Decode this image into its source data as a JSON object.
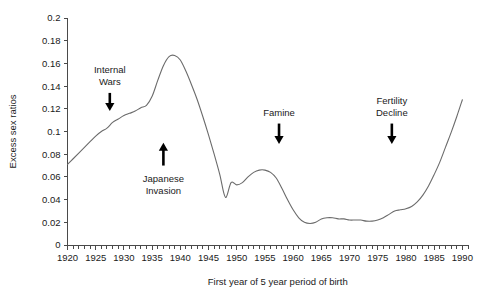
{
  "chart_data": {
    "type": "line",
    "title": "",
    "xlabel": "First year of 5 year period of birth",
    "ylabel": "Excess sex ratios",
    "xlim": [
      1920,
      1991
    ],
    "ylim": [
      0,
      0.2
    ],
    "ytick_labels": [
      "0",
      "0.02",
      "0.04",
      "0.06",
      "0.08",
      "0.1",
      "0.12",
      "0.14",
      "0.16",
      "0.18",
      "0.2"
    ],
    "ytick_values": [
      0,
      0.02,
      0.04,
      0.06,
      0.08,
      0.1,
      0.12,
      0.14,
      0.16,
      0.18,
      0.2
    ],
    "xtick_labels": [
      "1920",
      "1925",
      "1930",
      "1935",
      "1940",
      "1945",
      "1950",
      "1955",
      "1960",
      "1965",
      "1970",
      "1975",
      "1980",
      "1985",
      "1990"
    ],
    "xtick_values": [
      1920,
      1925,
      1930,
      1935,
      1940,
      1945,
      1950,
      1955,
      1960,
      1965,
      1970,
      1975,
      1980,
      1985,
      1990
    ],
    "minor_tick_step": 1,
    "grid": false,
    "legend": false,
    "line_color": "#6b6b6b",
    "series": [
      {
        "name": "Excess sex ratios",
        "x": [
          1920,
          1921,
          1922,
          1923,
          1924,
          1925,
          1926,
          1927,
          1928,
          1929,
          1930,
          1931,
          1932,
          1933,
          1934,
          1935,
          1936,
          1937,
          1938,
          1939,
          1940,
          1941,
          1942,
          1943,
          1944,
          1945,
          1946,
          1947,
          1948,
          1949,
          1950,
          1951,
          1952,
          1953,
          1954,
          1955,
          1956,
          1957,
          1958,
          1959,
          1960,
          1961,
          1962,
          1963,
          1964,
          1965,
          1966,
          1967,
          1968,
          1969,
          1970,
          1971,
          1972,
          1973,
          1974,
          1975,
          1976,
          1977,
          1978,
          1979,
          1980,
          1981,
          1982,
          1983,
          1984,
          1985,
          1986,
          1987,
          1988,
          1989,
          1990
        ],
        "y": [
          0.071,
          0.076,
          0.081,
          0.086,
          0.091,
          0.096,
          0.1,
          0.103,
          0.108,
          0.111,
          0.114,
          0.116,
          0.118,
          0.121,
          0.123,
          0.131,
          0.145,
          0.158,
          0.166,
          0.167,
          0.163,
          0.153,
          0.141,
          0.128,
          0.113,
          0.097,
          0.08,
          0.062,
          0.042,
          0.055,
          0.053,
          0.055,
          0.06,
          0.064,
          0.066,
          0.066,
          0.064,
          0.059,
          0.05,
          0.04,
          0.031,
          0.024,
          0.02,
          0.019,
          0.02,
          0.023,
          0.024,
          0.024,
          0.023,
          0.023,
          0.022,
          0.022,
          0.022,
          0.021,
          0.021,
          0.022,
          0.024,
          0.027,
          0.03,
          0.031,
          0.032,
          0.034,
          0.038,
          0.044,
          0.052,
          0.062,
          0.073,
          0.086,
          0.099,
          0.113,
          0.128
        ]
      }
    ],
    "annotations": [
      {
        "label_line1": "Internal",
        "label_line2": "Wars",
        "x": 1927.5,
        "arrow_top": 0.134,
        "arrow_bottom": 0.118,
        "direction": "down"
      },
      {
        "label_line1": "Japanese",
        "label_line2": "Invasion",
        "x": 1937.0,
        "arrow_top": 0.09,
        "arrow_bottom": 0.07,
        "direction": "up"
      },
      {
        "label_line1": "Famine",
        "label_line2": "",
        "x": 1957.5,
        "arrow_top": 0.107,
        "arrow_bottom": 0.089,
        "direction": "down"
      },
      {
        "label_line1": "Fertility",
        "label_line2": "Decline",
        "x": 1977.5,
        "arrow_top": 0.107,
        "arrow_bottom": 0.089,
        "direction": "down"
      }
    ]
  }
}
